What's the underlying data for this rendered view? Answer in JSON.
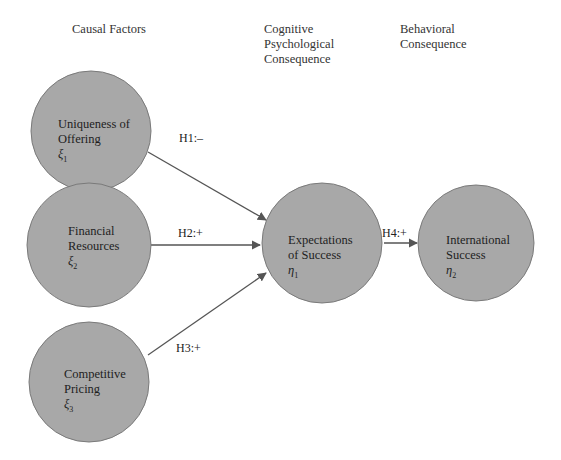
{
  "headers": {
    "causal": [
      "Causal Factors"
    ],
    "cognitive": [
      "Cognitive",
      "Psychological",
      "Consequence"
    ],
    "behavioral": [
      "Behavioral",
      "Consequence"
    ]
  },
  "colors": {
    "node_fill": "#a8a8a8",
    "node_stroke": "#7a7a7a",
    "edge": "#555555",
    "background": "#ffffff"
  },
  "nodes": [
    {
      "id": "xi1",
      "lines": [
        "Uniqueness of",
        "Offering"
      ],
      "symbol": "ξ",
      "subscript": "1"
    },
    {
      "id": "xi2",
      "lines": [
        "Financial",
        "Resources"
      ],
      "symbol": "ξ",
      "subscript": "2"
    },
    {
      "id": "xi3",
      "lines": [
        "Competitive",
        "Pricing"
      ],
      "symbol": "ξ",
      "subscript": "3"
    },
    {
      "id": "eta1",
      "lines": [
        "Expectations",
        "of Success"
      ],
      "symbol": "η",
      "subscript": "1"
    },
    {
      "id": "eta2",
      "lines": [
        "International",
        "Success"
      ],
      "symbol": "η",
      "subscript": "2"
    }
  ],
  "edges": [
    {
      "from": "xi1",
      "to": "eta1",
      "label": "H1:–"
    },
    {
      "from": "xi2",
      "to": "eta1",
      "label": "H2:+"
    },
    {
      "from": "xi3",
      "to": "eta1",
      "label": "H3:+"
    },
    {
      "from": "eta1",
      "to": "eta2",
      "label": "H4:+"
    }
  ]
}
